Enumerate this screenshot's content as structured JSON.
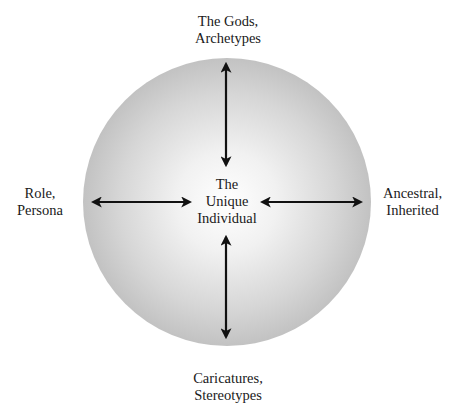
{
  "diagram": {
    "title": "",
    "center": {
      "lines": [
        "The",
        "Unique",
        "Individual"
      ]
    },
    "poles": {
      "top": {
        "lines": [
          "The Gods,",
          "Archetypes"
        ]
      },
      "bottom": {
        "lines": [
          "Caricatures,",
          "Stereotypes"
        ]
      },
      "left": {
        "lines": [
          "Role,",
          "Persona"
        ]
      },
      "right": {
        "lines": [
          "Ancestral,",
          "Inherited"
        ]
      }
    },
    "arrows": [
      {
        "from": "center",
        "to": "top",
        "style": "double-headed"
      },
      {
        "from": "center",
        "to": "bottom",
        "style": "double-headed"
      },
      {
        "from": "center",
        "to": "left",
        "style": "double-headed"
      },
      {
        "from": "center",
        "to": "right",
        "style": "double-headed"
      }
    ],
    "colors": {
      "circle_center": "#ffffff",
      "circle_edge": "#c4c4c4",
      "arrow": "#111111",
      "text": "#1a1a1a",
      "background": "#ffffff"
    }
  }
}
